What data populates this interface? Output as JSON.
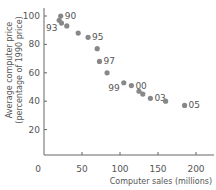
{
  "chart_data": {
    "type": "scatter",
    "title": "",
    "xlabel": "Computer sales (millions)",
    "ylabel": "Average computer price (percentage of 1990 price)",
    "xlim": [
      0,
      220
    ],
    "ylim": [
      0,
      105
    ],
    "xticks": [
      "0",
      "50",
      "100",
      "150",
      "200"
    ],
    "yticks": [
      "20",
      "40",
      "60",
      "80",
      "100"
    ],
    "grid": false,
    "points": [
      {
        "x": 22,
        "y": 100,
        "label": "90"
      },
      {
        "x": 20,
        "y": 97,
        "label": ""
      },
      {
        "x": 23,
        "y": 95,
        "label": "93"
      },
      {
        "x": 30,
        "y": 93,
        "label": ""
      },
      {
        "x": 45,
        "y": 88,
        "label": ""
      },
      {
        "x": 58,
        "y": 85,
        "label": "95"
      },
      {
        "x": 70,
        "y": 77,
        "label": ""
      },
      {
        "x": 73,
        "y": 68,
        "label": "97"
      },
      {
        "x": 83,
        "y": 60,
        "label": ""
      },
      {
        "x": 105,
        "y": 53,
        "label": "99"
      },
      {
        "x": 115,
        "y": 51,
        "label": "00"
      },
      {
        "x": 125,
        "y": 47,
        "label": ""
      },
      {
        "x": 130,
        "y": 45,
        "label": ""
      },
      {
        "x": 140,
        "y": 42,
        "label": "03"
      },
      {
        "x": 160,
        "y": 40,
        "label": ""
      },
      {
        "x": 185,
        "y": 37,
        "label": "05"
      }
    ]
  }
}
